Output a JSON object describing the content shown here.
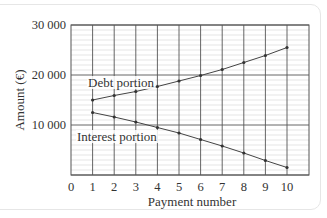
{
  "chart_data": {
    "type": "line",
    "title": "",
    "xlabel": "Payment number",
    "ylabel": "Amount (€)",
    "x": [
      1,
      2,
      3,
      4,
      5,
      6,
      7,
      8,
      9,
      10
    ],
    "x_ticks": [
      "0",
      "1",
      "2",
      "3",
      "4",
      "5",
      "6",
      "7",
      "8",
      "9",
      "10"
    ],
    "y_ticks": [
      "10000",
      "20000",
      "30000"
    ],
    "y_tick_labels": [
      "10 000",
      "20 000",
      "30 000"
    ],
    "xlim": [
      0,
      11
    ],
    "ylim": [
      0,
      30000
    ],
    "grid": {
      "major_y": 10000,
      "minor_y": 1000,
      "major_x": 1
    },
    "series": [
      {
        "name": "Debt portion",
        "values": [
          15000,
          15900,
          16700,
          17700,
          18800,
          19900,
          21100,
          22500,
          23900,
          25500
        ]
      },
      {
        "name": "Interest portion",
        "values": [
          12500,
          11600,
          10600,
          9500,
          8400,
          7100,
          5800,
          4400,
          2900,
          1500
        ]
      }
    ],
    "annotations": [
      {
        "text": "Debt portion",
        "near_series": "Debt portion"
      },
      {
        "text": "Interest portion",
        "near_series": "Interest portion"
      }
    ],
    "legend": "none (inline labels)"
  }
}
